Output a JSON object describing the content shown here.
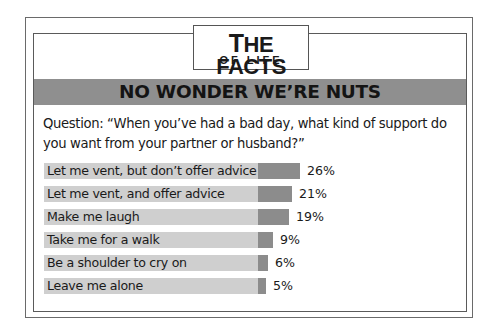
{
  "logo": {
    "line1_first": "T",
    "line1_rest": "HE FACTS",
    "line2": "OF LIFE"
  },
  "banner": {
    "title": "NO WONDER WE’RE NUTS"
  },
  "question": {
    "text": "Question: “When you’ve had a bad day, what kind of support do you want from your partner or husband?”"
  },
  "rows": [
    {
      "label": "Let me vent, but don’t offer advice",
      "value": 26,
      "display": "26%"
    },
    {
      "label": "Let me vent, and offer advice",
      "value": 21,
      "display": "21%"
    },
    {
      "label": "Make me laugh",
      "value": 19,
      "display": "19%"
    },
    {
      "label": "Take me for a walk",
      "value": 9,
      "display": "9%"
    },
    {
      "label": "Be a shoulder to cry on",
      "value": 6,
      "display": "6%"
    },
    {
      "label": "Leave me alone",
      "value": 5,
      "display": "5%"
    }
  ],
  "colors": {
    "label_bar": "#cfcfcf",
    "value_bar": "#8c8c8c",
    "banner": "#8f8f8f"
  },
  "chart_data": {
    "type": "bar",
    "orientation": "horizontal",
    "title": "NO WONDER WE’RE NUTS",
    "subtitle": "Question: “When you’ve had a bad day, what kind of support do you want from your partner or husband?”",
    "categories": [
      "Let me vent, but don’t offer advice",
      "Let me vent, and offer advice",
      "Make me laugh",
      "Take me for a walk",
      "Be a shoulder to cry on",
      "Leave me alone"
    ],
    "values": [
      26,
      21,
      19,
      9,
      6,
      5
    ],
    "unit": "%",
    "xlabel": "",
    "ylabel": "",
    "grid": false,
    "legend": null
  }
}
